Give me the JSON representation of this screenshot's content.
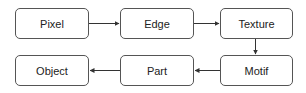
{
  "diagram": {
    "nodes": [
      {
        "id": "pixel",
        "label": "Pixel"
      },
      {
        "id": "edge",
        "label": "Edge"
      },
      {
        "id": "texture",
        "label": "Texture"
      },
      {
        "id": "motif",
        "label": "Motif"
      },
      {
        "id": "part",
        "label": "Part"
      },
      {
        "id": "object",
        "label": "Object"
      }
    ],
    "edges": [
      {
        "from": "Pixel",
        "to": "Edge"
      },
      {
        "from": "Edge",
        "to": "Texture"
      },
      {
        "from": "Texture",
        "to": "Motif"
      },
      {
        "from": "Motif",
        "to": "Part"
      },
      {
        "from": "Part",
        "to": "Object"
      }
    ],
    "colors": {
      "stroke": "#555555",
      "text": "#222222",
      "background": "#ffffff"
    }
  }
}
